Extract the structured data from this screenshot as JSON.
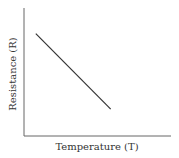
{
  "chart_data": {
    "type": "line",
    "title": "",
    "xlabel": "Temperature (T)",
    "ylabel": "Resistance (R)",
    "grid": false,
    "legend": null,
    "xlim": [
      0,
      1
    ],
    "ylim": [
      0,
      1
    ],
    "series": [
      {
        "name": "Resistance vs Temperature",
        "x": [
          0.08,
          0.59
        ],
        "y": [
          0.8,
          0.21
        ]
      }
    ],
    "annotations": []
  },
  "colors": {
    "axis": "#555555",
    "line": "#333333"
  }
}
